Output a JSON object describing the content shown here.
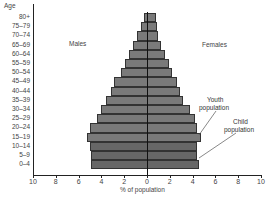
{
  "chart_data": {
    "type": "bar",
    "orientation": "horizontal",
    "subtype": "population-pyramid",
    "title": "",
    "ylabel": "Age",
    "xlabel": "% of population",
    "xlim": [
      -10,
      10
    ],
    "x_ticks": [
      "10",
      "8",
      "6",
      "4",
      "2",
      "0",
      "2",
      "4",
      "6",
      "8",
      "10"
    ],
    "categories": [
      "80+",
      "75–79",
      "70–74",
      "65–69",
      "60–64",
      "55–59",
      "50–54",
      "45–49",
      "40–44",
      "35–39",
      "30–34",
      "25–29",
      "20–24",
      "15–19",
      "10–14",
      "5–9",
      "0–4"
    ],
    "series": [
      {
        "name": "Males",
        "values": [
          0.3,
          0.5,
          0.9,
          1.2,
          1.6,
          1.9,
          2.3,
          2.9,
          3.2,
          3.6,
          4.0,
          4.4,
          5.0,
          5.3,
          5.0,
          4.9,
          4.9
        ]
      },
      {
        "name": "Females",
        "values": [
          0.8,
          0.9,
          1.0,
          1.2,
          1.6,
          1.9,
          2.2,
          2.6,
          2.9,
          3.2,
          3.8,
          4.2,
          4.4,
          4.7,
          4.4,
          4.4,
          4.6
        ]
      }
    ],
    "annotations": [
      {
        "text": "Males",
        "position": "upper-left"
      },
      {
        "text": "Females",
        "position": "upper-right"
      },
      {
        "text": "Youth population",
        "points_to": [
          "15–19",
          "20–24"
        ]
      },
      {
        "text": "Child population",
        "points_to": [
          "0–4",
          "5–9",
          "10–14"
        ]
      }
    ],
    "grid": false,
    "legend": "none"
  },
  "labels": {
    "age_axis": "Age",
    "males": "Males",
    "females": "Females",
    "youth_line1": "Youth",
    "youth_line2": "population",
    "child_line1": "Child",
    "child_line2": "population",
    "x_axis": "% of population"
  },
  "colors": {
    "bar_default": "#7a7a7a",
    "bar_child": "#676767",
    "outline": "#333333"
  }
}
